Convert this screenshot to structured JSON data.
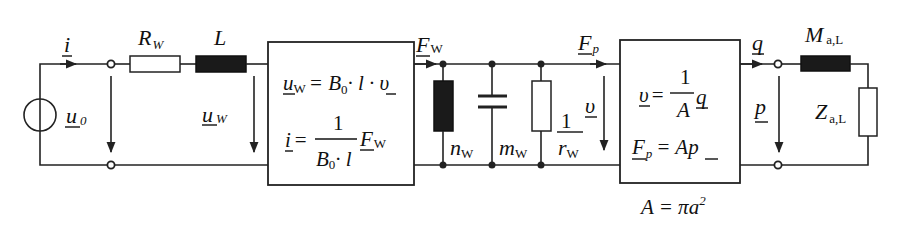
{
  "diagram": {
    "type": "electro-mechano-acoustic equivalent circuit",
    "colors": {
      "line": "#222222",
      "inductor_fill": "#1a1a1a",
      "background": "#ffffff"
    },
    "electrical": {
      "source": {
        "symbol": "u",
        "sub": "0",
        "icon": "voltage-source-icon"
      },
      "current": {
        "symbol": "i"
      },
      "resistor": {
        "symbol": "R",
        "sub": "W"
      },
      "inductor": {
        "symbol": "L"
      },
      "voltage": {
        "symbol": "u",
        "sub": "W"
      }
    },
    "transducer1": {
      "eq1": {
        "lhs": "u",
        "lhs_sub": "W",
        "rhs": "= B",
        "rhs_sub": "0",
        "rhs_tail": "· l · υ"
      },
      "eq2": {
        "lhs": "i",
        "equals": "=",
        "num": "1",
        "den": "B",
        "den_sub": "0",
        "den_tail": "· l",
        "var": "F",
        "var_sub": "W"
      }
    },
    "mechanical": {
      "force_in": {
        "symbol": "F",
        "sub": "W"
      },
      "compliance": {
        "symbol": "n",
        "sub": "W"
      },
      "mass": {
        "symbol": "m",
        "sub": "W"
      },
      "resistance": {
        "num": "1",
        "den": "r",
        "den_sub": "W"
      },
      "velocity": {
        "symbol": "υ"
      },
      "force_out": {
        "symbol": "F",
        "sub": "p"
      }
    },
    "transducer2": {
      "eq1": {
        "lhs": "υ",
        "equals": "=",
        "num": "1",
        "den": "A",
        "var": "q"
      },
      "eq2": {
        "lhs": "F",
        "lhs_sub": "p",
        "rhs": "= A",
        "var": "p"
      },
      "area": {
        "text": "A = πa",
        "exp": "2"
      }
    },
    "acoustic": {
      "volume_flow": {
        "symbol": "q"
      },
      "pressure": {
        "symbol": "p"
      },
      "mass": {
        "symbol": "M",
        "sub": "a,L"
      },
      "impedance": {
        "symbol": "Z",
        "sub": "a,L"
      }
    }
  }
}
